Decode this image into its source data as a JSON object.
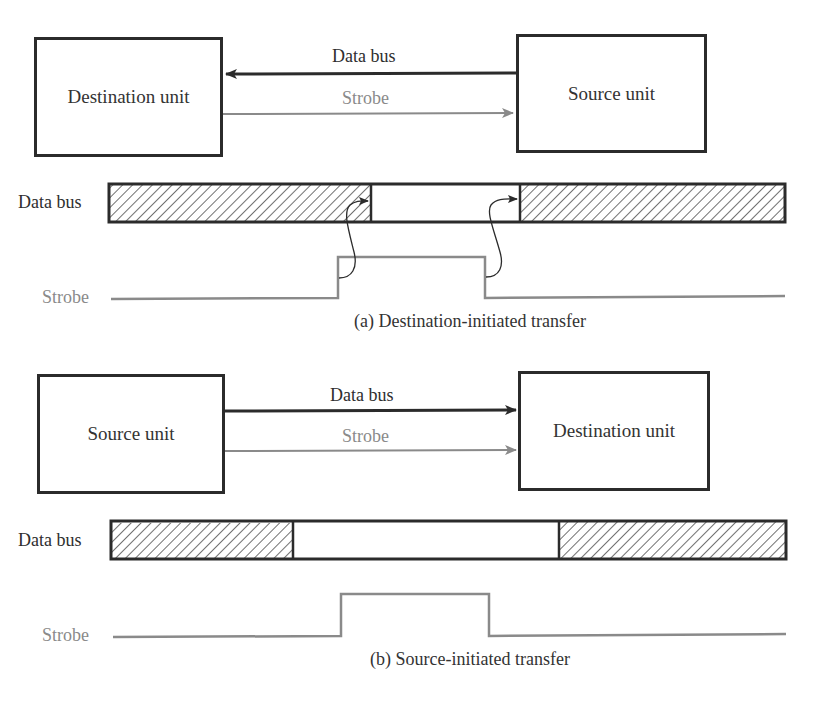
{
  "figure_a": {
    "left_box": "Destination unit",
    "right_box": "Source unit",
    "data_bus_arrow_label": "Data bus",
    "strobe_arrow_label": "Strobe",
    "data_bus_direction": "source-to-destination (right-to-left)",
    "strobe_direction": "destination-to-source (left-to-right)",
    "timing_data_bus_label": "Data bus",
    "timing_strobe_label": "Strobe",
    "caption": "(a) Destination-initiated transfer"
  },
  "figure_b": {
    "left_box": "Source unit",
    "right_box": "Destination unit",
    "data_bus_arrow_label": "Data bus",
    "strobe_arrow_label": "Strobe",
    "data_bus_direction": "source-to-destination (left-to-right)",
    "strobe_direction": "source-to-destination (left-to-right)",
    "timing_data_bus_label": "Data bus",
    "timing_strobe_label": "Strobe",
    "caption": "(b) Source-initiated transfer"
  },
  "colors": {
    "data_line": "#2b2b2b",
    "strobe_line": "#8a8a8a",
    "hatch": "#333333"
  }
}
